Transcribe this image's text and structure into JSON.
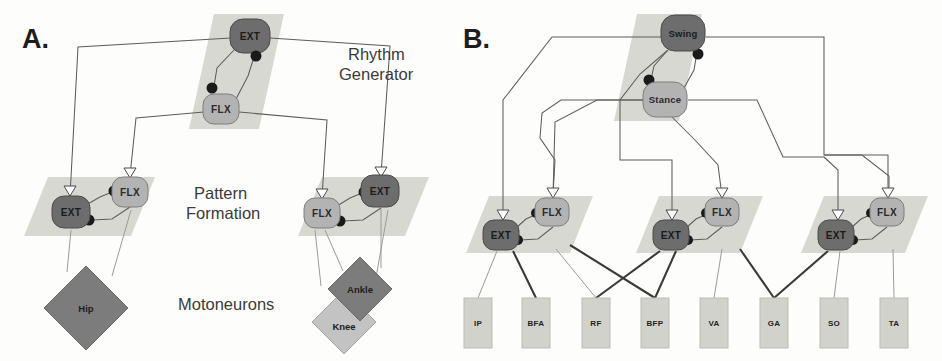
{
  "figure": {
    "width": 942,
    "height": 361,
    "background": "#fdfdfc"
  },
  "panels": [
    {
      "id": "A",
      "letter": "A.",
      "letter_pos": {
        "x": 22,
        "y": 48
      },
      "layer_labels": [
        {
          "name": "rhythm-generator-label",
          "line1": "Rhythm",
          "line2": "Generator",
          "x": 348,
          "y": 62
        },
        {
          "name": "pattern-formation-label",
          "line1": "Pattern",
          "line2": "Formation",
          "x": 232,
          "y": 201
        },
        {
          "name": "motoneurons-label",
          "line1": "Motoneurons",
          "line2": "",
          "x": 240,
          "y": 305
        }
      ],
      "planes": [
        {
          "name": "rhythm-generator-plane",
          "points": "214,14 282,14 258,128 190,128",
          "fill": "#d8d8d3"
        },
        {
          "name": "pattern-formation-plane-left",
          "points": "46,176 152,176 128,235 22,235",
          "fill": "#d8d8d3"
        },
        {
          "name": "pattern-formation-plane-right",
          "points": "320,176 426,176 402,235 296,235",
          "fill": "#d8d8d3"
        }
      ],
      "nodes": [
        {
          "name": "rg-ext-node",
          "label": "EXT",
          "type": "dark",
          "cx": 250,
          "cy": 36,
          "rx": 20,
          "ry": 17
        },
        {
          "name": "rg-flx-node",
          "label": "FLX",
          "type": "light",
          "cx": 221,
          "cy": 109,
          "rx": 18,
          "ry": 15
        },
        {
          "name": "pf-left-ext-node",
          "label": "EXT",
          "type": "dark",
          "cx": 71,
          "cy": 212,
          "rx": 19,
          "ry": 16
        },
        {
          "name": "pf-left-flx-node",
          "label": "FLX",
          "type": "light",
          "cx": 130,
          "cy": 192,
          "rx": 18,
          "ry": 15
        },
        {
          "name": "pf-right-flx-node",
          "label": "FLX",
          "type": "light",
          "cx": 322,
          "cy": 213,
          "rx": 18,
          "ry": 15
        },
        {
          "name": "pf-right-ext-node",
          "label": "EXT",
          "type": "dark",
          "cx": 380,
          "cy": 191,
          "rx": 19,
          "ry": 16
        }
      ],
      "motoneurons": [
        {
          "name": "motoneuron-hip",
          "label": "Hip",
          "type": "dark",
          "cx": 86,
          "cy": 308,
          "r": 42
        },
        {
          "name": "motoneuron-ankle",
          "label": "Ankle",
          "type": "dark",
          "cx": 360,
          "cy": 289,
          "r": 32
        },
        {
          "name": "motoneuron-knee",
          "label": "Knee",
          "type": "light",
          "cx": 344,
          "cy": 322,
          "r": 32
        }
      ]
    },
    {
      "id": "B",
      "letter": "B.",
      "letter_pos": {
        "x": 463,
        "y": 48
      },
      "planes": [
        {
          "name": "rhythm-generator-plane-b",
          "points": "639,14 700,14 678,120 617,120",
          "fill": "#d8d8d3"
        },
        {
          "name": "pattern-formation-plane-1",
          "points": "487,195 590,195 567,252 464,252",
          "fill": "#d8d8d3"
        },
        {
          "name": "pattern-formation-plane-2",
          "points": "657,195 760,195 737,252 634,252",
          "fill": "#d8d8d3"
        },
        {
          "name": "pattern-formation-plane-3",
          "points": "822,195 925,195 902,252 799,252",
          "fill": "#d8d8d3"
        }
      ],
      "nodes": [
        {
          "name": "rg-swing-node",
          "label": "Swing",
          "type": "dark",
          "cx": 683,
          "cy": 33,
          "rx": 22,
          "ry": 18
        },
        {
          "name": "rg-stance-node",
          "label": "Stance",
          "type": "light",
          "cx": 665,
          "cy": 99,
          "rx": 22,
          "ry": 17
        },
        {
          "name": "pf1-ext-node",
          "label": "EXT",
          "type": "dark",
          "cx": 501,
          "cy": 235,
          "rx": 18,
          "ry": 15
        },
        {
          "name": "pf1-flx-node",
          "label": "FLX",
          "type": "light",
          "cx": 552,
          "cy": 212,
          "rx": 17,
          "ry": 14
        },
        {
          "name": "pf2-ext-node",
          "label": "EXT",
          "type": "dark",
          "cx": 671,
          "cy": 235,
          "rx": 18,
          "ry": 15
        },
        {
          "name": "pf2-flx-node",
          "label": "FLX",
          "type": "light",
          "cx": 722,
          "cy": 212,
          "rx": 17,
          "ry": 14
        },
        {
          "name": "pf3-ext-node",
          "label": "EXT",
          "type": "dark",
          "cx": 836,
          "cy": 235,
          "rx": 18,
          "ry": 15
        },
        {
          "name": "pf3-flx-node",
          "label": "FLX",
          "type": "light",
          "cx": 887,
          "cy": 212,
          "rx": 17,
          "ry": 14
        }
      ],
      "muscles": [
        {
          "name": "muscle-ip",
          "label": "IP",
          "x": 464,
          "y": 298,
          "w": 28,
          "h": 50
        },
        {
          "name": "muscle-bfa",
          "label": "BFA",
          "x": 522,
          "y": 298,
          "w": 28,
          "h": 50
        },
        {
          "name": "muscle-rf",
          "label": "RF",
          "x": 582,
          "y": 298,
          "w": 28,
          "h": 50
        },
        {
          "name": "muscle-bfp",
          "label": "BFP",
          "x": 641,
          "y": 298,
          "w": 28,
          "h": 50
        },
        {
          "name": "muscle-va",
          "label": "VA",
          "x": 700,
          "y": 298,
          "w": 28,
          "h": 50
        },
        {
          "name": "muscle-ga",
          "label": "GA",
          "x": 760,
          "y": 298,
          "w": 28,
          "h": 50
        },
        {
          "name": "muscle-so",
          "label": "SO",
          "x": 820,
          "y": 298,
          "w": 28,
          "h": 50
        },
        {
          "name": "muscle-ta",
          "label": "TA",
          "x": 880,
          "y": 298,
          "w": 28,
          "h": 50
        }
      ]
    }
  ],
  "colors": {
    "node_dark": "#6d6d6d",
    "node_light": "#b3b3b3",
    "plane": "#d8d8d3",
    "muscle_box": "#d2d2cd",
    "connection": "#5d5d5d",
    "inhibitory_dot": "#1a1a1a",
    "text": "#1d1d1d"
  },
  "legend_semantics": {
    "filled_circle": "inhibitory-synapse",
    "open_triangle": "excitatory-synapse",
    "dark_node": "extensor-or-swing-population",
    "light_node": "flexor-or-stance-population"
  }
}
